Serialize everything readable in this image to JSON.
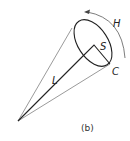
{
  "figure": {
    "caption": "(b)",
    "labels": {
      "H": "H",
      "S": "S",
      "L": "L",
      "C": "C"
    },
    "colors": {
      "stroke": "#222222",
      "thin_stroke": "#555555",
      "arc": "#444444",
      "background": "#ffffff"
    }
  }
}
